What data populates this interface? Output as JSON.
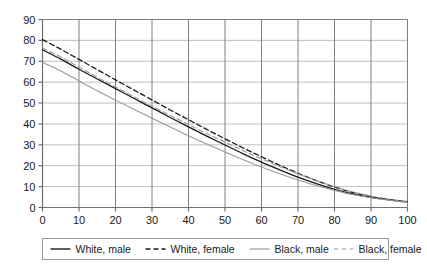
{
  "chart_data": {
    "type": "line",
    "title": "",
    "subtitle": "",
    "xlabel": "",
    "ylabel": "",
    "xlim": [
      0,
      100
    ],
    "ylim": [
      0,
      90
    ],
    "x_ticks": [
      0,
      10,
      20,
      30,
      40,
      50,
      60,
      70,
      80,
      90,
      100
    ],
    "y_ticks": [
      0,
      10,
      20,
      30,
      40,
      50,
      60,
      70,
      80,
      90
    ],
    "grid": true,
    "legend_position": "bottom",
    "x": [
      0,
      5,
      10,
      15,
      20,
      25,
      30,
      35,
      40,
      45,
      50,
      55,
      60,
      65,
      70,
      75,
      80,
      85,
      90,
      95,
      100
    ],
    "series": [
      {
        "name": "White, male",
        "style": "solid",
        "color": "#1a1a1a",
        "values": [
          75.5,
          71.0,
          66.2,
          61.5,
          56.9,
          52.3,
          47.7,
          43.1,
          38.6,
          34.2,
          29.9,
          25.7,
          21.7,
          18.0,
          14.5,
          11.4,
          8.7,
          6.5,
          4.8,
          3.6,
          2.6
        ]
      },
      {
        "name": "White, female",
        "style": "dashed",
        "color": "#1a1a1a",
        "values": [
          80.4,
          75.8,
          70.9,
          66.0,
          61.1,
          56.3,
          51.5,
          46.7,
          42.0,
          37.4,
          32.9,
          28.5,
          24.3,
          20.2,
          16.4,
          12.9,
          9.8,
          7.2,
          5.2,
          3.8,
          2.8
        ]
      },
      {
        "name": "Black, male",
        "style": "solid",
        "color": "#9a9a9a",
        "values": [
          69.5,
          65.4,
          60.6,
          55.9,
          51.4,
          47.0,
          42.7,
          38.5,
          34.4,
          30.4,
          26.6,
          22.9,
          19.4,
          16.2,
          13.2,
          10.5,
          8.2,
          6.2,
          4.7,
          3.5,
          2.5
        ]
      },
      {
        "name": "Black, female",
        "style": "dashed",
        "color": "#9a9a9a",
        "values": [
          76.3,
          72.1,
          67.2,
          62.4,
          57.7,
          53.1,
          48.5,
          44.1,
          39.7,
          35.4,
          31.3,
          27.2,
          23.3,
          19.6,
          16.1,
          12.9,
          10.0,
          7.5,
          5.5,
          4.0,
          2.9
        ]
      }
    ]
  },
  "axis": {
    "x_tick_labels": [
      "0",
      "10",
      "20",
      "30",
      "40",
      "50",
      "60",
      "70",
      "80",
      "90",
      "100"
    ],
    "y_tick_labels": [
      "0",
      "10",
      "20",
      "30",
      "40",
      "50",
      "60",
      "70",
      "80",
      "90"
    ]
  },
  "legend": {
    "items": [
      {
        "label": "White, male",
        "style": "solid",
        "color": "#1a1a1a"
      },
      {
        "label": "White, female",
        "style": "dashed",
        "color": "#1a1a1a"
      },
      {
        "label": "Black, male",
        "style": "solid",
        "color": "#9a9a9a"
      },
      {
        "label": "Black, female",
        "style": "dashed",
        "color": "#9a9a9a"
      }
    ]
  },
  "colors": {
    "plot_background": "#ffffff",
    "axis_line": "#6f6f6f",
    "grid_vertical": "#808080",
    "grid_horizontal": "#bfbfbf",
    "legend_border": "#9a9a9a",
    "text": "#1a1a1a"
  }
}
